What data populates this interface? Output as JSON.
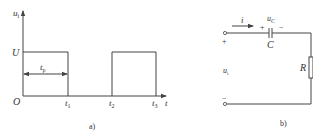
{
  "figure_a": {
    "caption": "a)",
    "y_axis_label": "u",
    "y_axis_label_sub": "i",
    "x_axis_label": "t",
    "origin_label": "O",
    "level_label": "U",
    "pulse_width_label": "t",
    "pulse_width_sub": "p",
    "ticks": [
      {
        "label": "t",
        "sub": "1"
      },
      {
        "label": "t",
        "sub": "2"
      },
      {
        "label": "t",
        "sub": "3"
      }
    ],
    "waveform": "rectangular pulses: high U from O to t1, low from t1 to t2, high U from t2 to t3"
  },
  "figure_b": {
    "caption": "b)",
    "current_label": "i",
    "capacitor_label": "C",
    "capacitor_voltage_label": "u",
    "capacitor_voltage_sub": "C",
    "cap_plus": "+",
    "cap_minus": "−",
    "resistor_label": "R",
    "input_label": "u",
    "input_sub": "i",
    "terminal_plus": "+",
    "terminal_minus": "−"
  },
  "colors": {
    "line": "#444444",
    "text": "#333333",
    "background": "#ffffff"
  }
}
